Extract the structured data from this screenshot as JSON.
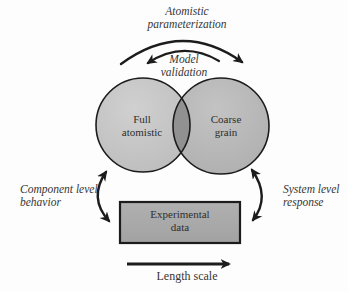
{
  "diagram": {
    "labels": {
      "atomistic_parameterization": "Atomistic\nparameterization",
      "model_validation": "Model\nvalidation",
      "full_atomistic": "Full\natomistic",
      "coarse_grain": "Coarse\ngrain",
      "component_level": "Component level\nbehavior",
      "system_level": "System level\nresponse",
      "experimental_data": "Experimental\ndata",
      "length_scale": "Length scale"
    },
    "colors": {
      "left_circle_fill": "#c6c6c6",
      "right_circle_fill": "#b7b7b7",
      "overlap_fill": "#919191",
      "rect_fill": "#a9a9a9",
      "stroke": "#1c1c1c",
      "text": "#363636"
    },
    "shapes": {
      "left_circle": "Full atomistic model",
      "right_circle": "Coarse grain model",
      "bottom_rect": "Experimental data",
      "arrows": [
        "atomistic-parameterization (left circle to right circle, over top)",
        "model-validation (right circle back to left circle)",
        "component-level-behavior (left circle to experimental data, double-headed)",
        "system-level-response (right circle to experimental data, double-headed)",
        "length-scale (pointing right)"
      ]
    }
  }
}
